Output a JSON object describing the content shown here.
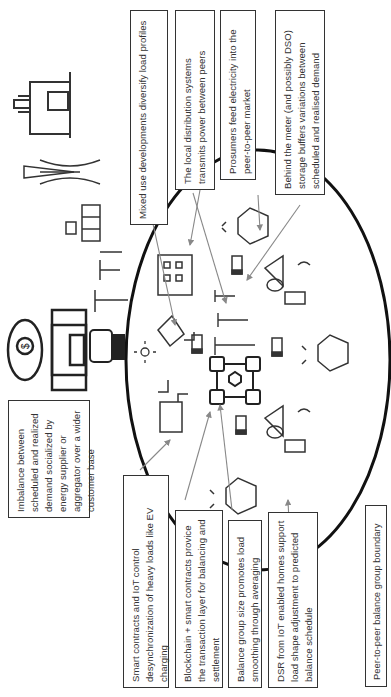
{
  "diagram": {
    "orientation": "rotated -90deg (text reads bottom-to-top)",
    "boundary_label": "Peer-to-peer balance group boundary",
    "annotations": [
      {
        "id": "mixed-use",
        "text": "Mixed use developments diversify load profiles"
      },
      {
        "id": "local-distribution",
        "text": "The local distribution systems transmits power between peers"
      },
      {
        "id": "prosumers",
        "text": "Prosumers feed electricity into the peer-to-peer market"
      },
      {
        "id": "behind-meter",
        "text": "Behind the meter (and possibly DSO) storage buffers variations between scheduled and realised demand"
      },
      {
        "id": "imbalance",
        "text": "Imbalance between scheduled and realized demand socialized by energy supplier or aggregator over a wider customer base"
      },
      {
        "id": "smart-contracts-iot",
        "text": "Smart contracts and IoT control desynchronization of heavy loads like EV charging"
      },
      {
        "id": "blockchain",
        "text": "Blockchain + smart contracts provice the transaction layer for balancing and settlement"
      },
      {
        "id": "balance-group-size",
        "text": "Balance group size promotes load smoothing through averaging"
      },
      {
        "id": "dsr",
        "text": "DSR from IoT enabled homes support load shape adjustment to predicted balance schedule"
      }
    ],
    "icons": [
      "power-plant-icon",
      "transmission-tower-icon",
      "substation-icon",
      "utility-pole-icon",
      "bank-money-bag-icon",
      "smart-meter-icon",
      "office-building-icon",
      "solar-panel-icon",
      "sun-icon",
      "battery-icon",
      "factory-icon",
      "blockchain-network-icon",
      "smart-home-iot-icon",
      "prosumer-house-icon"
    ],
    "colors": {
      "line": "#333333",
      "arrow": "#888888",
      "boundary": "#111111"
    }
  }
}
